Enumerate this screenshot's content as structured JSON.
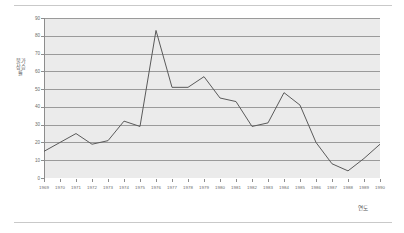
{
  "figure": {
    "background_color": "#ffffff",
    "plot_background_color": "#ebebeb",
    "border_rule_color": "#c9c9c9",
    "gridline_color": "#9a9a9a",
    "axis_color": "#8d8d8d",
    "series_color": "#5a5a5a",
    "tick_label_color": "#6b6b6b",
    "axis_title_color": "#5b5b5b"
  },
  "chart_data": {
    "type": "line",
    "title": "",
    "subtitle": "",
    "xlabel": "연도",
    "ylabel": "물가상승률",
    "categories": [
      "1969",
      "1970",
      "1971",
      "1972",
      "1973",
      "1974",
      "1975",
      "1976",
      "1977",
      "1978",
      "1979",
      "1980",
      "1981",
      "1982",
      "1983",
      "1984",
      "1985",
      "1986",
      "1987",
      "1988",
      "1989",
      "1990"
    ],
    "x": [
      1969,
      1970,
      1971,
      1972,
      1973,
      1974,
      1975,
      1976,
      1977,
      1978,
      1979,
      1980,
      1981,
      1982,
      1983,
      1984,
      1985,
      1986,
      1987,
      1988,
      1989,
      1990
    ],
    "values": [
      15,
      20,
      25,
      19,
      21,
      32,
      29,
      83,
      51,
      51,
      57,
      45,
      43,
      29,
      31,
      48,
      41,
      20,
      8,
      4,
      11,
      19
    ],
    "series": [
      {
        "name": "물가상승률",
        "values": [
          15,
          20,
          25,
          19,
          21,
          32,
          29,
          83,
          51,
          51,
          57,
          45,
          43,
          29,
          31,
          48,
          41,
          20,
          8,
          4,
          11,
          19
        ]
      }
    ],
    "ylim": [
      0,
      90
    ],
    "yticks": [
      0,
      10,
      20,
      30,
      40,
      50,
      60,
      70,
      80,
      90
    ],
    "ytick_labels": [
      "0",
      "10",
      "20",
      "30",
      "40",
      "50",
      "60",
      "70",
      "80",
      "90"
    ],
    "xlim": [
      1969,
      1990
    ],
    "grid": true,
    "grid_axis": "y",
    "legend": false,
    "legend_position": "none",
    "markers": false,
    "annotations": []
  }
}
